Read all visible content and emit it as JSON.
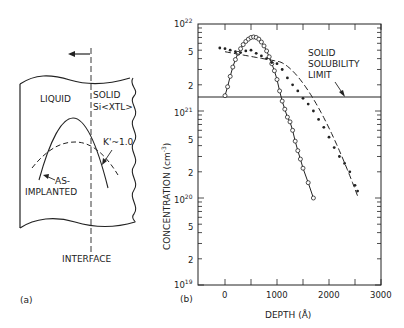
{
  "panel_a": {
    "label": "(a)",
    "liquid_label": "LIQUID",
    "solid_label_1": "SOLID",
    "solid_label_2": "Si<XTL>",
    "k_label": "K'~1.0",
    "implanted_label_1": "AS-",
    "implanted_label_2": "IMPLANTED",
    "interface_label": "INTERFACE"
  },
  "panel_b": {
    "label": "(b)",
    "annotation_1": "SOLID",
    "annotation_2": "SOLUBILITY",
    "annotation_3": "LIMIT"
  },
  "chart_data": {
    "type": "scatter",
    "title": "",
    "xlabel": "DEPTH (Å)",
    "ylabel": "CONCENTRATION (cm⁻³)",
    "yscale": "log",
    "xlim": [
      -500,
      3000
    ],
    "ylim": [
      1e+19,
      1e+22
    ],
    "x_ticks": [
      "0",
      "1000",
      "2000",
      "3000"
    ],
    "y_ticks": [
      "10^19",
      "2",
      "5",
      "10^20",
      "2",
      "5",
      "10^21",
      "2",
      "5",
      "10^22"
    ],
    "solubility_limit": 1.5e+21,
    "series": [
      {
        "name": "As-implanted (open circles, solid line)",
        "marker": "open-circle",
        "line": "solid",
        "x": [
          0,
          50,
          100,
          150,
          200,
          250,
          300,
          350,
          400,
          450,
          500,
          550,
          600,
          650,
          700,
          750,
          800,
          850,
          900,
          950,
          1000,
          1050,
          1100,
          1150,
          1200,
          1250,
          1300,
          1350,
          1400,
          1450,
          1500,
          1600,
          1700
        ],
        "y": [
          1.5e+21,
          1.9e+21,
          2.5e+21,
          3.2e+21,
          3.9e+21,
          4.6e+21,
          5.2e+21,
          5.8e+21,
          6.3e+21,
          6.7e+21,
          7e+21,
          7.1e+21,
          7e+21,
          6.7e+21,
          6.2e+21,
          5.6e+21,
          4.9e+21,
          4.2e+21,
          3.5e+21,
          2.9e+21,
          2.3e+21,
          1.7e+21,
          1.3e+21,
          1.05e+21,
          8.5e+20,
          7.5e+20,
          6e+20,
          4.5e+20,
          3.5e+20,
          2.8e+20,
          2.2e+20,
          1.5e+20,
          1e+20
        ]
      },
      {
        "name": "After laser annealing (filled dots, dashed line)",
        "marker": "filled-dot",
        "line": "dashed",
        "x": [
          -100,
          0,
          100,
          200,
          300,
          400,
          500,
          600,
          700,
          800,
          900,
          1000,
          1100,
          1200,
          1300,
          1400,
          1500,
          1600,
          1700,
          1800,
          1900,
          2000,
          2100,
          2200,
          2300,
          2400,
          2500,
          2550
        ],
        "y": [
          5.3e+21,
          5.2e+21,
          5e+21,
          4.8e+21,
          4.7e+21,
          4.9e+21,
          5e+21,
          4.6e+21,
          4.3e+21,
          4e+21,
          3.6e+21,
          3.5e+21,
          3e+21,
          2.4e+21,
          2e+21,
          1.7e+21,
          1.4e+21,
          1.2e+21,
          1e+21,
          8e+20,
          6.5e+20,
          5e+20,
          3.8e+20,
          3e+20,
          2.5e+20,
          2e+20,
          1.4e+20,
          1.2e+20
        ]
      }
    ],
    "fit_curves": [
      {
        "name": "As-implanted fit",
        "style": "solid"
      },
      {
        "name": "Annealed fit",
        "style": "dashed",
        "end_value": 4.5e+19,
        "end_x": 2550
      }
    ],
    "annotations": [
      "SOLID SOLUBILITY LIMIT"
    ]
  }
}
